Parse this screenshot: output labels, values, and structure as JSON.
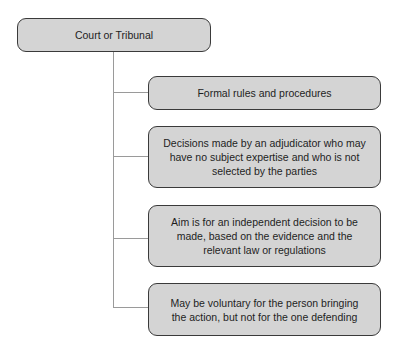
{
  "diagram": {
    "root": {
      "label": "Court or Tribunal"
    },
    "children": [
      {
        "label": "Formal rules and procedures"
      },
      {
        "label": "Decisions made by an adjudicator who may have no subject expertise and who is not selected by the parties"
      },
      {
        "label": "Aim is for an independent decision to be made, based on the evidence and the relevant law or regulations"
      },
      {
        "label": "May be voluntary for the person bringing the action, but not for the one defending"
      }
    ],
    "colors": {
      "box_fill": "#d4d4d4",
      "box_border": "#3a3a3a",
      "connector": "#9a9a9a"
    }
  }
}
